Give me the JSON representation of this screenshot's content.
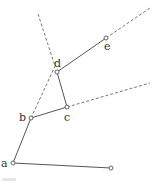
{
  "diagram": {
    "type": "linkage",
    "points": {
      "a": {
        "x": 13,
        "y": 163,
        "label": "a"
      },
      "b": {
        "x": 31,
        "y": 118,
        "label": "b"
      },
      "c": {
        "x": 67,
        "y": 107,
        "label": "c"
      },
      "d": {
        "x": 57,
        "y": 72,
        "label": "d"
      },
      "e": {
        "x": 106,
        "y": 38,
        "label": "e"
      },
      "f": {
        "x": 111,
        "y": 168,
        "label": ""
      }
    },
    "solid_segments": [
      [
        "a",
        "b"
      ],
      [
        "b",
        "c"
      ],
      [
        "c",
        "d"
      ],
      [
        "d",
        "e"
      ],
      [
        "a",
        "f"
      ]
    ],
    "dashed_segments": [
      {
        "from": [
          31,
          118
        ],
        "to": [
          56,
          64
        ]
      },
      {
        "from": [
          38,
          14
        ],
        "to": [
          55,
          66
        ]
      },
      {
        "from": [
          106,
          38
        ],
        "to": [
          150,
          8
        ]
      },
      {
        "from": [
          67,
          107
        ],
        "to": [
          150,
          83
        ]
      }
    ]
  }
}
